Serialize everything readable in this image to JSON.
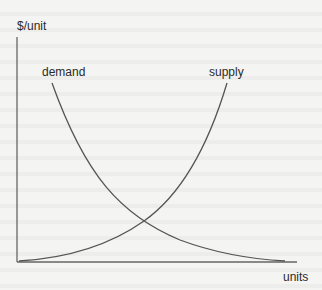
{
  "diagram": {
    "y_axis_label": "$/unit",
    "x_axis_label": "units",
    "curves": [
      {
        "name": "demand",
        "label": "demand",
        "shape": "convex decreasing"
      },
      {
        "name": "supply",
        "label": "supply",
        "shape": "convex increasing"
      }
    ],
    "colors": {
      "line": "#555555",
      "text": "#2a2a2a",
      "background": "#f4f4f2"
    }
  }
}
